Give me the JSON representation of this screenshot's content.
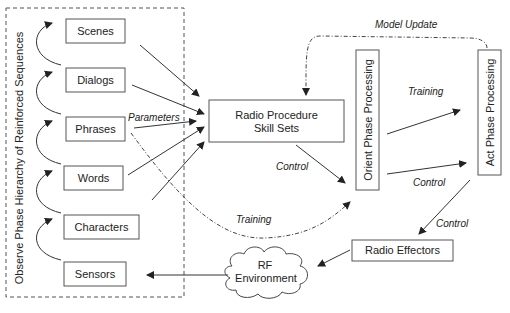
{
  "diagram": {
    "observe_group_label": "Observe Phase Hierarchy of Reinforced Sequences",
    "hierarchy": [
      {
        "id": "scenes",
        "label": "Scenes"
      },
      {
        "id": "dialogs",
        "label": "Dialogs"
      },
      {
        "id": "phrases",
        "label": "Phrases"
      },
      {
        "id": "words",
        "label": "Words"
      },
      {
        "id": "characters",
        "label": "Characters"
      },
      {
        "id": "sensors",
        "label": "Sensors"
      }
    ],
    "radio_procedure": {
      "line1": "Radio Procedure",
      "line2": "Skill Sets"
    },
    "orient": "Orient Phase Processing",
    "act": "Act Phase Processing",
    "effectors": "Radio Effectors",
    "rf": {
      "line1": "RF",
      "line2": "Environment"
    },
    "edge_labels": {
      "parameters": "Parameters",
      "model_update": "Model Update",
      "training_top": "Training",
      "control_mid": "Control",
      "control_orient": "Control",
      "control_act": "Control",
      "training_bottom": "Training"
    }
  }
}
